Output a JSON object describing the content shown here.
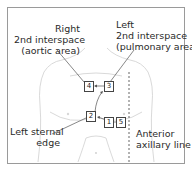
{
  "labels": {
    "right_2nd": {
      "line1": "Right",
      "line2": "2nd interspace",
      "line3": "(aortic area)"
    },
    "left_2nd": {
      "line1": "Left",
      "line2": "2nd interspace",
      "line3": "(pulmonary area)"
    },
    "left_sternal": {
      "line1": "Left sternal",
      "line2": "edge"
    },
    "anterior_axillary": {
      "line1": "Anterior",
      "line2": "axillary line"
    }
  },
  "points": [
    {
      "id": "1",
      "label": "1"
    },
    {
      "id": "2",
      "label": "2"
    },
    {
      "id": "3",
      "label": "3"
    },
    {
      "id": "4",
      "label": "4"
    },
    {
      "id": "5",
      "label": "5"
    }
  ],
  "colors": {
    "outline": "#c8c8c8",
    "leader": "#555555",
    "frame": "#9a9a9a",
    "text": "#2a2a2a"
  }
}
